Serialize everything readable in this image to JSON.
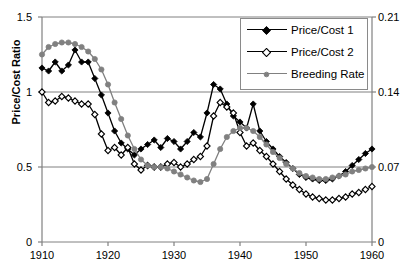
{
  "chart_data": {
    "type": "line",
    "title": "",
    "xlabel": "",
    "ylabel": "Price/Cost Ratio",
    "ylabel_right": "Colts/ Total Draft Animals",
    "xlim": [
      1910,
      1960
    ],
    "ylim": [
      0,
      1.5
    ],
    "ylim_right": [
      0,
      0.21
    ],
    "xticks": [
      1910,
      1920,
      1930,
      1940,
      1950,
      1960
    ],
    "yticks": [
      0,
      0.5,
      1,
      1.5
    ],
    "yticks_right": [
      0,
      0.07,
      0.14,
      0.21
    ],
    "grid": true,
    "legend_position": "top-right",
    "x": [
      1910,
      1911,
      1912,
      1913,
      1914,
      1915,
      1916,
      1917,
      1918,
      1919,
      1920,
      1921,
      1922,
      1923,
      1924,
      1925,
      1926,
      1927,
      1928,
      1929,
      1930,
      1931,
      1932,
      1933,
      1934,
      1935,
      1936,
      1937,
      1938,
      1939,
      1940,
      1941,
      1942,
      1943,
      1944,
      1945,
      1946,
      1947,
      1948,
      1949,
      1950,
      1951,
      1952,
      1953,
      1954,
      1955,
      1956,
      1957,
      1958,
      1959,
      1960
    ],
    "series": [
      {
        "name": "Price/Cost 1",
        "color": "#000000",
        "marker": "filled-diamond",
        "values": [
          1.16,
          1.14,
          1.2,
          1.14,
          1.18,
          1.28,
          1.2,
          1.2,
          1.09,
          0.98,
          0.86,
          0.74,
          0.66,
          0.62,
          0.58,
          0.62,
          0.65,
          0.68,
          0.63,
          0.69,
          0.67,
          0.62,
          0.67,
          0.73,
          0.7,
          0.86,
          1.05,
          1.02,
          0.92,
          0.84,
          0.8,
          0.76,
          0.92,
          0.74,
          0.67,
          0.62,
          0.57,
          0.53,
          0.49,
          0.45,
          0.43,
          0.42,
          0.41,
          0.41,
          0.42,
          0.44,
          0.47,
          0.51,
          0.55,
          0.59,
          0.62
        ]
      },
      {
        "name": "Price/Cost 2",
        "color": "#000000",
        "marker": "open-diamond",
        "values": [
          1.0,
          0.93,
          0.94,
          0.97,
          0.96,
          0.94,
          0.92,
          0.92,
          0.85,
          0.72,
          0.61,
          0.63,
          0.58,
          0.63,
          0.52,
          0.48,
          0.51,
          0.5,
          0.5,
          0.52,
          0.53,
          0.5,
          0.52,
          0.55,
          0.57,
          0.64,
          0.84,
          0.93,
          0.9,
          0.86,
          0.73,
          0.64,
          0.66,
          0.61,
          0.57,
          0.52,
          0.47,
          0.42,
          0.38,
          0.35,
          0.32,
          0.3,
          0.29,
          0.28,
          0.28,
          0.29,
          0.3,
          0.32,
          0.33,
          0.35,
          0.37
        ]
      },
      {
        "name": "Breeding Rate",
        "color": "#808080",
        "marker": "filled-circle",
        "values": [
          1.25,
          1.3,
          1.32,
          1.33,
          1.33,
          1.32,
          1.3,
          1.27,
          1.22,
          1.15,
          1.05,
          0.93,
          0.82,
          0.71,
          0.62,
          0.55,
          0.51,
          0.5,
          0.5,
          0.49,
          0.47,
          0.45,
          0.43,
          0.41,
          0.4,
          0.42,
          0.52,
          0.62,
          0.7,
          0.74,
          0.76,
          0.76,
          0.74,
          0.7,
          0.65,
          0.6,
          0.56,
          0.52,
          0.49,
          0.46,
          0.44,
          0.43,
          0.42,
          0.42,
          0.43,
          0.44,
          0.45,
          0.47,
          0.48,
          0.49,
          0.5
        ]
      }
    ]
  },
  "legend": {
    "items": [
      {
        "label": "Price/Cost 1"
      },
      {
        "label": "Price/Cost 2"
      },
      {
        "label": "Breeding Rate"
      }
    ]
  },
  "axes": {
    "left_title": "Price/Cost Ratio",
    "right_title": "Colts/ Total Draft Animals",
    "left_ticks": [
      "1.5",
      "1",
      "0.5",
      "0"
    ],
    "right_ticks": [
      "0.21",
      "0.14",
      "0.07",
      "0"
    ],
    "x_ticks": [
      "1910",
      "1920",
      "1930",
      "1940",
      "1950",
      "1960"
    ]
  }
}
